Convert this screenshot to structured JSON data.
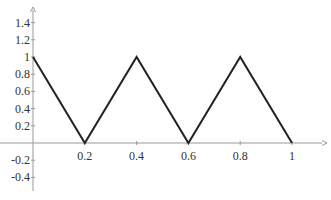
{
  "chart_data": {
    "type": "line",
    "title": "",
    "xlabel": "",
    "ylabel": "",
    "x": [
      0,
      0.2,
      0.4,
      0.6,
      0.8,
      1
    ],
    "series": [
      {
        "name": "triangle wave",
        "values": [
          1,
          0,
          1,
          0,
          1,
          0
        ],
        "color": "#222222"
      }
    ],
    "x_ticks": [
      "0.2",
      "0.4",
      "0.6",
      "0.8",
      "1"
    ],
    "y_ticks": [
      "-0.4",
      "-0.2",
      "0.2",
      "0.4",
      "0.6",
      "0.8",
      "1",
      "1.2",
      "1.4"
    ],
    "xlim": [
      0,
      1.1
    ],
    "ylim": [
      -0.55,
      1.6
    ],
    "grid": false,
    "legend": "none",
    "axis_color": "#999999"
  }
}
